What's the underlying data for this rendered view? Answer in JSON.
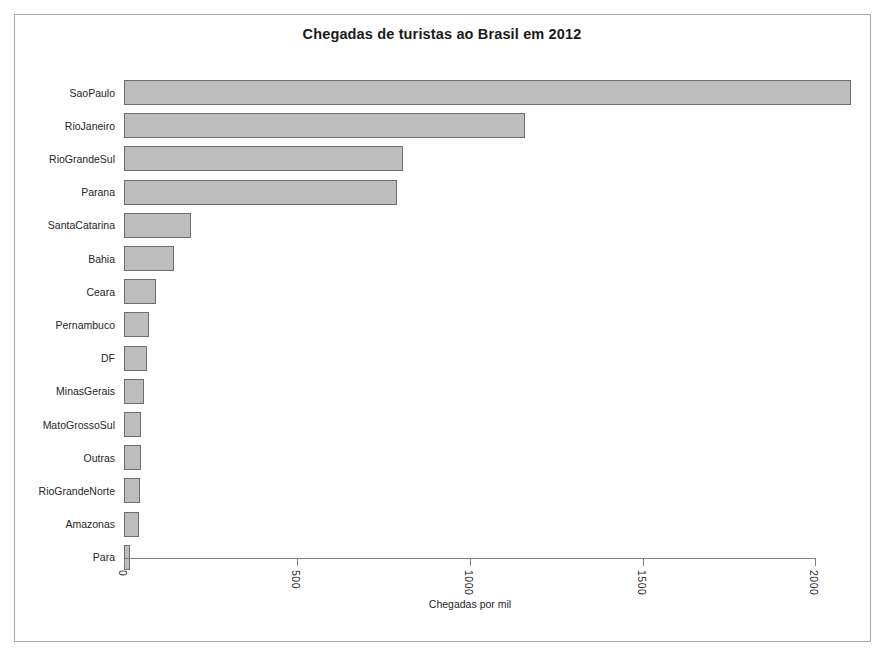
{
  "chart_data": {
    "type": "bar",
    "orientation": "horizontal",
    "title": "Chegadas de turistas ao Brasil em 2012",
    "xlabel": "Chegadas por mil",
    "ylabel": "",
    "xlim": [
      0,
      2000
    ],
    "xticks": [
      0,
      500,
      1000,
      1500,
      2000
    ],
    "xtick_labels": [
      "0",
      "500",
      "1000",
      "1500",
      "2000"
    ],
    "grid": false,
    "legend": false,
    "bar_fill": "#bdbdbd",
    "bar_border": "#6e6e6e",
    "categories": [
      "SaoPaulo",
      "RioJaneiro",
      "RioGrandeSul",
      "Parana",
      "SantaCatarina",
      "Bahia",
      "Ceara",
      "Pernambuco",
      "DF",
      "MinasGerais",
      "MatoGrossoSul",
      "Outras",
      "RioGrandeNorte",
      "Amazonas",
      "Para"
    ],
    "values": [
      2100,
      1160,
      805,
      790,
      195,
      145,
      93,
      72,
      67,
      58,
      48,
      48,
      46,
      44,
      18
    ]
  }
}
